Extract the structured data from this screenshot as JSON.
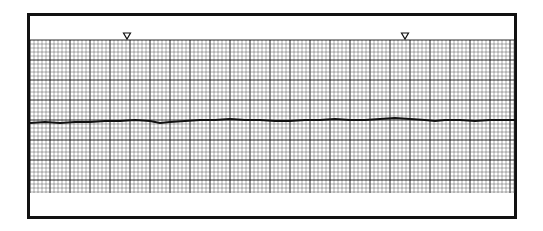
{
  "chart_data": {
    "type": "line",
    "title": "",
    "xlabel": "",
    "ylabel": "",
    "grid": true,
    "grid_style": {
      "minor_spacing_px": 4,
      "major_every": 5,
      "minor_color": "#555555",
      "major_color": "#111111"
    },
    "markers": [
      {
        "shape": "inverted-triangle",
        "x_px": 127
      },
      {
        "shape": "inverted-triangle",
        "x_px": 405
      }
    ],
    "series": [
      {
        "name": "trace",
        "color": "#111111",
        "points_px": [
          [
            30,
            123
          ],
          [
            45,
            122
          ],
          [
            60,
            123
          ],
          [
            75,
            122
          ],
          [
            90,
            122
          ],
          [
            105,
            121
          ],
          [
            120,
            121
          ],
          [
            135,
            120
          ],
          [
            150,
            121
          ],
          [
            160,
            123
          ],
          [
            170,
            122
          ],
          [
            185,
            121
          ],
          [
            200,
            120
          ],
          [
            215,
            120
          ],
          [
            230,
            119
          ],
          [
            245,
            120
          ],
          [
            260,
            120
          ],
          [
            275,
            121
          ],
          [
            290,
            121
          ],
          [
            305,
            120
          ],
          [
            320,
            120
          ],
          [
            335,
            119
          ],
          [
            350,
            120
          ],
          [
            365,
            120
          ],
          [
            380,
            119
          ],
          [
            395,
            118
          ],
          [
            410,
            119
          ],
          [
            425,
            120
          ],
          [
            435,
            121
          ],
          [
            445,
            120
          ],
          [
            460,
            120
          ],
          [
            475,
            121
          ],
          [
            490,
            120
          ],
          [
            505,
            120
          ],
          [
            515,
            120
          ]
        ]
      }
    ]
  }
}
